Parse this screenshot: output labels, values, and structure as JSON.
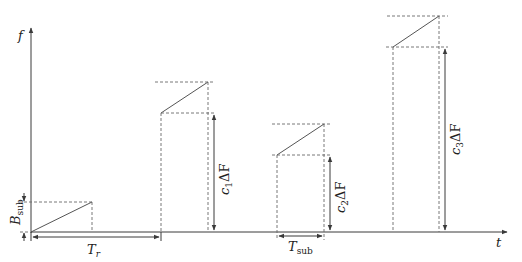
{
  "diagram": {
    "axes": {
      "y_label": "f",
      "x_label": "t"
    },
    "labels": {
      "bandwidth_sub": {
        "main": "B",
        "sub": "sub"
      },
      "period_ramp": {
        "main": "T",
        "sub": "r"
      },
      "period_sub": {
        "main": "T",
        "sub": "sub"
      },
      "offset_1": {
        "coef": "c",
        "index": "1",
        "delta": "ΔF"
      },
      "offset_2": {
        "coef": "c",
        "index": "2",
        "delta": "ΔF"
      },
      "offset_3": {
        "coef": "c",
        "index": "3",
        "delta": "ΔF"
      }
    },
    "ramps": [
      {
        "name": "ramp-0",
        "start_time_px": 31,
        "offset_label": null
      },
      {
        "name": "ramp-1",
        "start_time_px": 161,
        "offset_label": "c1ΔF"
      },
      {
        "name": "ramp-2",
        "start_time_px": 277,
        "offset_label": "c2ΔF"
      },
      {
        "name": "ramp-3",
        "start_time_px": 393,
        "offset_label": "c3ΔF"
      }
    ]
  }
}
